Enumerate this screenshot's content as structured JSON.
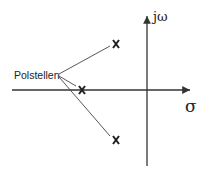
{
  "diagram": {
    "type": "pole-zero plot (s-plane)",
    "axes": {
      "horizontal_label": "σ",
      "vertical_label": "jω"
    },
    "annotation": "Polstellen",
    "poles": [
      {
        "id": "pole-upper",
        "symbol": "x",
        "x": 116,
        "y": 44
      },
      {
        "id": "pole-real",
        "symbol": "x",
        "x": 82,
        "y": 90
      },
      {
        "id": "pole-lower",
        "symbol": "x",
        "x": 116,
        "y": 140
      }
    ],
    "colors": {
      "line": "#333333",
      "text": "#222222"
    }
  }
}
